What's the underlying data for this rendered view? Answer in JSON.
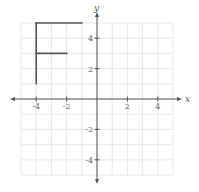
{
  "chart_data": {
    "type": "line",
    "title": "",
    "xlabel": "x",
    "ylabel": "y",
    "xlim": [
      -5,
      5
    ],
    "ylim": [
      -5,
      5
    ],
    "grid": true,
    "x_ticks": [
      -4,
      -2,
      2,
      4
    ],
    "y_ticks": [
      4,
      2,
      -2,
      -4
    ],
    "x_tick_labels": [
      "-4",
      "-2",
      "2",
      "4"
    ],
    "y_tick_labels": [
      "4",
      "2",
      "-2",
      "-4"
    ],
    "series": [
      {
        "name": "F shape",
        "segments": [
          {
            "from": [
              -4,
              1
            ],
            "to": [
              -4,
              5
            ]
          },
          {
            "from": [
              -4,
              5
            ],
            "to": [
              -1,
              5
            ]
          },
          {
            "from": [
              -4,
              3
            ],
            "to": [
              -2,
              3
            ]
          }
        ],
        "color": "#555555"
      }
    ]
  },
  "colors": {
    "grid": "#e2e2e2",
    "axis": "#555555",
    "shape": "#555555"
  }
}
